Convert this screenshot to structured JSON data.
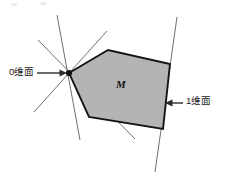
{
  "figure": {
    "canvas": {
      "width": 233,
      "height": 189,
      "background": "#ffffff"
    },
    "set_label": "M",
    "labels": {
      "zero_face": "0维面",
      "one_face": "1维面"
    },
    "colors": {
      "fill": "#b4b4b4",
      "outline": "#141414",
      "hyperplane": "#5f5f5f",
      "arrow": "#3a3a3a",
      "text": "#1a1a1a"
    },
    "polygon": {
      "name": "convex-set-M",
      "vertices": [
        {
          "x": 69,
          "y": 73
        },
        {
          "x": 108,
          "y": 50
        },
        {
          "x": 170,
          "y": 64
        },
        {
          "x": 163,
          "y": 129
        },
        {
          "x": 89,
          "y": 117
        }
      ]
    },
    "hyperplanes": [
      {
        "name": "supporting-line-1",
        "x1": 57,
        "y1": 15,
        "x2": 80,
        "y2": 140
      },
      {
        "name": "supporting-line-2",
        "x1": 34,
        "y1": 112,
        "x2": 107,
        "y2": 31
      },
      {
        "name": "supporting-line-3",
        "x1": 38,
        "y1": 40,
        "x2": 135,
        "y2": 139
      },
      {
        "name": "supporting-line-edge",
        "x1": 177,
        "y1": 17,
        "x2": 155,
        "y2": 172
      }
    ],
    "vertex_point": {
      "name": "zero-dimensional-face-point",
      "x": 69,
      "y": 73,
      "r": 3.1
    },
    "annotations": [
      {
        "name": "zero-face-arrow",
        "x1": 37,
        "y1": 73,
        "x2": 66,
        "y2": 73,
        "direction": "right"
      },
      {
        "name": "one-face-arrow",
        "x1": 183,
        "y1": 103,
        "x2": 166,
        "y2": 103,
        "direction": "left"
      }
    ]
  }
}
